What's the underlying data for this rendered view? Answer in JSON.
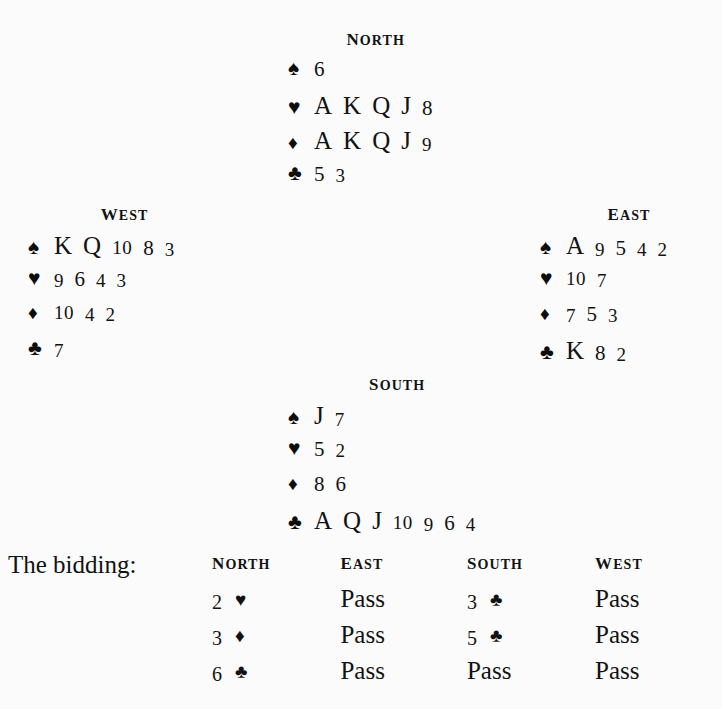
{
  "suits": {
    "spade": "♠",
    "heart": "♥",
    "diamond": "♦",
    "club": "♣"
  },
  "hands": {
    "north": {
      "label": "NORTH",
      "spades": [
        "6"
      ],
      "hearts": [
        "A",
        "K",
        "Q",
        "J",
        "8"
      ],
      "diamonds": [
        "A",
        "K",
        "Q",
        "J",
        "9"
      ],
      "clubs": [
        "5",
        "3"
      ]
    },
    "west": {
      "label": "WEST",
      "spades": [
        "K",
        "Q",
        "10",
        "8",
        "3"
      ],
      "hearts": [
        "9",
        "6",
        "4",
        "3"
      ],
      "diamonds": [
        "10",
        "4",
        "2"
      ],
      "clubs": [
        "7"
      ]
    },
    "east": {
      "label": "EAST",
      "spades": [
        "A",
        "9",
        "5",
        "4",
        "2"
      ],
      "hearts": [
        "10",
        "7"
      ],
      "diamonds": [
        "7",
        "5",
        "3"
      ],
      "clubs": [
        "K",
        "8",
        "2"
      ]
    },
    "south": {
      "label": "SOUTH",
      "spades": [
        "J",
        "7"
      ],
      "hearts": [
        "5",
        "2"
      ],
      "diamonds": [
        "8",
        "6"
      ],
      "clubs": [
        "A",
        "Q",
        "J",
        "10",
        "9",
        "6",
        "4"
      ]
    }
  },
  "bidding": {
    "title": "The bidding:",
    "columns": [
      "NORTH",
      "EAST",
      "SOUTH",
      "WEST"
    ],
    "rows": [
      [
        {
          "level": "2",
          "suit": "♥"
        },
        {
          "call": "Pass"
        },
        {
          "level": "3",
          "suit": "♣"
        },
        {
          "call": "Pass"
        }
      ],
      [
        {
          "level": "3",
          "suit": "♦"
        },
        {
          "call": "Pass"
        },
        {
          "level": "5",
          "suit": "♣"
        },
        {
          "call": "Pass"
        }
      ],
      [
        {
          "level": "6",
          "suit": "♣"
        },
        {
          "call": "Pass"
        },
        {
          "call": "Pass"
        },
        {
          "call": "Pass"
        }
      ]
    ]
  },
  "colors": {
    "background": "#fbfbfb",
    "ink": "#121212"
  }
}
